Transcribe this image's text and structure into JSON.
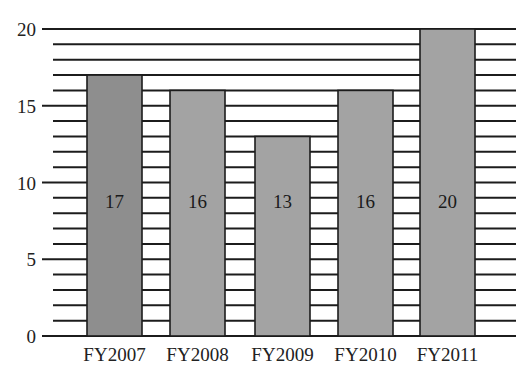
{
  "chart_data": {
    "type": "bar",
    "title": "",
    "xlabel": "",
    "ylabel": "",
    "categories": [
      "FY2007",
      "FY2008",
      "FY2009",
      "FY2010",
      "FY2011"
    ],
    "values": [
      17,
      16,
      13,
      16,
      20
    ],
    "data_labels": [
      "17",
      "16",
      "13",
      "16",
      "20"
    ],
    "ylim": [
      0,
      20
    ],
    "y_ticks": [
      0,
      5,
      10,
      15,
      20
    ],
    "y_tick_labels": [
      "0",
      "5",
      "10",
      "15",
      "20"
    ],
    "minor_gridlines_every": 1,
    "grid": true,
    "legend": null,
    "colors": {
      "bar_fill": "#a3a3a3",
      "bar_fill_first": "#8e8e8e",
      "bar_stroke": "#1c1c1c",
      "grid": "#1c1c1c",
      "background": "#ffffff"
    }
  }
}
